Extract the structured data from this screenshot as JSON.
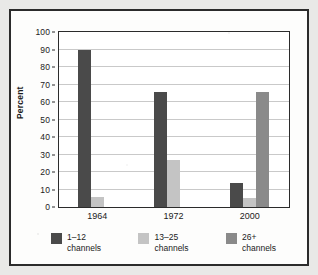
{
  "figure": {
    "frame_color": "#2b2b2b",
    "page_background": "#e9e9e7",
    "plot_background": "#ffffff"
  },
  "chart_data": {
    "type": "bar",
    "title": "",
    "subtitle": "",
    "xlabel": "",
    "ylabel": "Percent",
    "categories": [
      "1964",
      "1972",
      "2000"
    ],
    "series": [
      {
        "name": "1–12 channels",
        "legend_line1": "1–12",
        "legend_line2": "channels",
        "color": "#4a4a4a",
        "values": [
          90,
          66,
          14
        ]
      },
      {
        "name": "13–25 channels",
        "legend_line1": "13–25",
        "legend_line2": "channels",
        "color": "#c4c4c4",
        "values": [
          6,
          27,
          5
        ]
      },
      {
        "name": "26+ channels",
        "legend_line1": "26+",
        "legend_line2": "channels",
        "color": "#8a8a8a",
        "values": [
          0,
          0,
          66
        ]
      }
    ],
    "ylim": [
      0,
      100
    ],
    "ytick_step": 10,
    "yticks": [
      "0",
      "10",
      "20",
      "30",
      "40",
      "50",
      "60",
      "70",
      "80",
      "90",
      "100"
    ],
    "grid": true,
    "grid_axis": "y",
    "grid_color": "#c9c9c9",
    "legend_position": "bottom"
  }
}
